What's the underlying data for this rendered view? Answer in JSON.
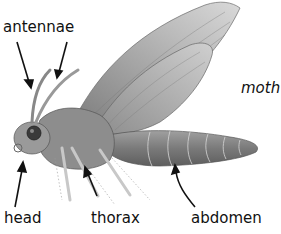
{
  "diagram": {
    "title": "moth",
    "labels": {
      "antennae": "antennae",
      "head": "head",
      "thorax": "thorax",
      "abdomen": "abdomen",
      "moth": "moth"
    },
    "colors": {
      "background": "#ffffff",
      "text": "#111111",
      "body_shading": "#8a8a8a",
      "wing_shading": "#a8a8a8"
    }
  }
}
